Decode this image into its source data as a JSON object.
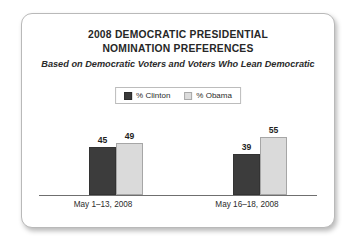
{
  "chart_data": {
    "type": "bar",
    "title": "2008 DEMOCRATIC PRESIDENTIAL NOMINATION PREFERENCES",
    "title_lines": [
      "2008 DEMOCRATIC PRESIDENTIAL",
      "NOMINATION PREFERENCES"
    ],
    "subtitle": "Based on Democratic Voters and Voters Who Lean Democratic",
    "categories": [
      "May 1–13, 2008",
      "May 16–18, 2008"
    ],
    "series": [
      {
        "name": "% Clinton",
        "values": [
          45,
          39
        ],
        "color": "#3c3c3c"
      },
      {
        "name": "% Obama",
        "values": [
          49,
          55
        ],
        "color": "#dadada"
      }
    ],
    "xlabel": "",
    "ylabel": "",
    "ylim": [
      0,
      70
    ],
    "grid": false,
    "legend_position": "top-center",
    "axis_line": true,
    "value_labels": true
  },
  "legend": {
    "entries": [
      {
        "label": "% Clinton",
        "swatch": "clinton-swatch"
      },
      {
        "label": "% Obama",
        "swatch": "obama-swatch"
      }
    ]
  },
  "colors": {
    "clinton": "#3c3c3c",
    "obama": "#dadada",
    "axis": "#6f6f6f",
    "text": "#2b2b2b",
    "card_border": "#b9b9b9",
    "background": "#ffffff"
  }
}
